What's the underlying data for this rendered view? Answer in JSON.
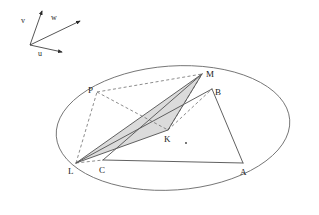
{
  "figure": {
    "background_color": "#ffffff",
    "stroke_color": "#5a5a5a",
    "dashed_color": "#6e6e6e",
    "shade_fill": "#d8d8d8",
    "label_color": "#1a1a1a"
  },
  "axes": {
    "origin": {
      "x": 30,
      "y": 45
    },
    "vectors": [
      {
        "name": "u",
        "label": "u",
        "tip_x": 62,
        "tip_y": 52,
        "label_x": 38,
        "label_y": 55
      },
      {
        "name": "v",
        "label": "v",
        "tip_x": 42,
        "tip_y": 11,
        "label_x": 22,
        "label_y": 22
      },
      {
        "name": "w",
        "label": "w",
        "tip_x": 80,
        "tip_y": 21,
        "label_x": 52,
        "label_y": 20
      }
    ]
  },
  "ellipse": {
    "cx": 173,
    "cy": 128,
    "rx": 117,
    "ry": 62,
    "rotation": -4
  },
  "points": [
    {
      "name": "L",
      "label": "L",
      "x": 76,
      "y": 163,
      "label_x": 68,
      "label_y": 174
    },
    {
      "name": "C",
      "label": "C",
      "x": 103,
      "y": 160,
      "label_x": 99,
      "label_y": 173
    },
    {
      "name": "A",
      "label": "A",
      "x": 243,
      "y": 163,
      "label_x": 240,
      "label_y": 175
    },
    {
      "name": "B",
      "label": "B",
      "x": 212,
      "y": 89,
      "label_x": 215,
      "label_y": 95
    },
    {
      "name": "M",
      "label": "M",
      "x": 202,
      "y": 74,
      "label_x": 206,
      "label_y": 76
    },
    {
      "name": "P",
      "label": "P",
      "x": 97,
      "y": 92,
      "label_x": 90,
      "label_y": 93
    },
    {
      "name": "K",
      "label": "K",
      "x": 168,
      "y": 130,
      "label_x": 166,
      "label_y": 142
    }
  ],
  "marker_dot": {
    "name": "interior-dot",
    "x": 186,
    "y": 143
  },
  "solid_segments": [
    {
      "name": "segment-C-A",
      "from": "C",
      "to": "A"
    },
    {
      "name": "segment-A-B",
      "from": "A",
      "to": "B"
    },
    {
      "name": "segment-B-L",
      "from": "B",
      "to": "L"
    },
    {
      "name": "segment-C-M",
      "from": "C",
      "to": "M"
    },
    {
      "name": "segment-L-M",
      "from": "L",
      "to": "M"
    },
    {
      "name": "segment-L-K",
      "from": "L",
      "to": "K"
    },
    {
      "name": "segment-K-M",
      "from": "K",
      "to": "M"
    }
  ],
  "dashed_segments": [
    {
      "name": "segment-L-C-dashed",
      "from": "L",
      "to": "C"
    },
    {
      "name": "segment-L-P-dashed",
      "from": "L",
      "to": "P"
    },
    {
      "name": "segment-P-M-dashed",
      "from": "P",
      "to": "M"
    },
    {
      "name": "segment-P-K-dashed",
      "from": "P",
      "to": "K"
    },
    {
      "name": "segment-K-M-dashed",
      "from": "K",
      "to": "M"
    },
    {
      "name": "segment-K-B-dashed",
      "from": "K",
      "to": "B"
    }
  ],
  "shaded_region": {
    "name": "shaded-triangle-LKM",
    "vertices": [
      "L",
      "K",
      "M"
    ],
    "fill": "#d9d9d9"
  }
}
